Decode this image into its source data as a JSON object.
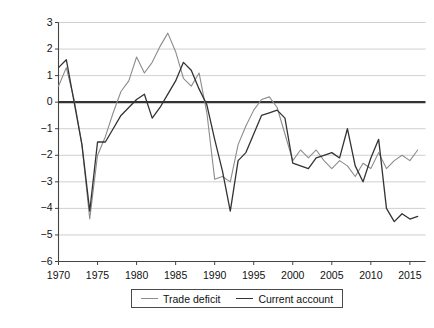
{
  "chart_data": {
    "type": "line",
    "title": "",
    "xlabel": "",
    "ylabel": "Percentage share of GDP",
    "xlim": [
      1970,
      2017
    ],
    "ylim": [
      -6,
      3
    ],
    "grid": true,
    "grid_axis": "y",
    "legend_position": "bottom-center",
    "x_ticks": [
      1970,
      1975,
      1980,
      1985,
      1990,
      1995,
      2000,
      2005,
      2010,
      2015
    ],
    "y_ticks": [
      3,
      2,
      1,
      0,
      -1,
      -2,
      -3,
      -4,
      -5,
      -6
    ],
    "y_tick_labels": [
      "3",
      "2",
      "1",
      "0",
      "−1",
      "−2",
      "−3",
      "−4",
      "−5",
      "−6"
    ],
    "zero_line": 0,
    "x": [
      1970,
      1971,
      1972,
      1973,
      1974,
      1975,
      1976,
      1977,
      1978,
      1979,
      1980,
      1981,
      1982,
      1983,
      1984,
      1985,
      1986,
      1987,
      1988,
      1989,
      1990,
      1991,
      1992,
      1993,
      1994,
      1995,
      1996,
      1997,
      1998,
      1999,
      2000,
      2001,
      2002,
      2003,
      2004,
      2005,
      2006,
      2007,
      2008,
      2009,
      2010,
      2011,
      2012,
      2013,
      2014,
      2015,
      2016
    ],
    "series": [
      {
        "name": "Trade deficit",
        "color": "#8c8c8c",
        "values": [
          0.6,
          1.3,
          0.1,
          -1.6,
          -4.4,
          -2.0,
          -1.3,
          -0.4,
          0.4,
          0.8,
          1.7,
          1.1,
          1.5,
          2.1,
          2.6,
          1.9,
          0.9,
          0.6,
          1.1,
          -0.4,
          -2.9,
          -2.8,
          -3.0,
          -1.6,
          -0.9,
          -0.3,
          0.1,
          0.2,
          -0.2,
          -1.2,
          -2.2,
          -1.8,
          -2.1,
          -1.8,
          -2.2,
          -2.5,
          -2.2,
          -2.4,
          -2.8,
          -2.3,
          -2.5,
          -1.9,
          -2.5,
          -2.2,
          -2.0,
          -2.2,
          -1.8
        ]
      },
      {
        "name": "Current account",
        "color": "#333333",
        "values": [
          1.3,
          1.6,
          0.0,
          -1.6,
          -4.1,
          -1.5,
          -1.5,
          -1.0,
          -0.5,
          -0.2,
          0.1,
          0.3,
          -0.6,
          -0.2,
          0.3,
          0.8,
          1.5,
          1.2,
          0.5,
          -0.1,
          -1.4,
          -2.6,
          -4.1,
          -2.2,
          -1.9,
          -1.2,
          -0.5,
          -0.4,
          -0.3,
          -0.6,
          -2.3,
          -2.4,
          -2.5,
          -2.1,
          -2.0,
          -1.9,
          -2.1,
          -1.0,
          -2.4,
          -3.0,
          -2.1,
          -1.4,
          -4.0,
          -4.5,
          -4.2,
          -4.4,
          -4.3
        ]
      }
    ]
  },
  "legend": {
    "items": [
      {
        "label": "Trade deficit",
        "color": "#8c8c8c"
      },
      {
        "label": "Current account",
        "color": "#333333"
      }
    ]
  },
  "axes": {
    "y_label": "Percentage share of GDP"
  }
}
